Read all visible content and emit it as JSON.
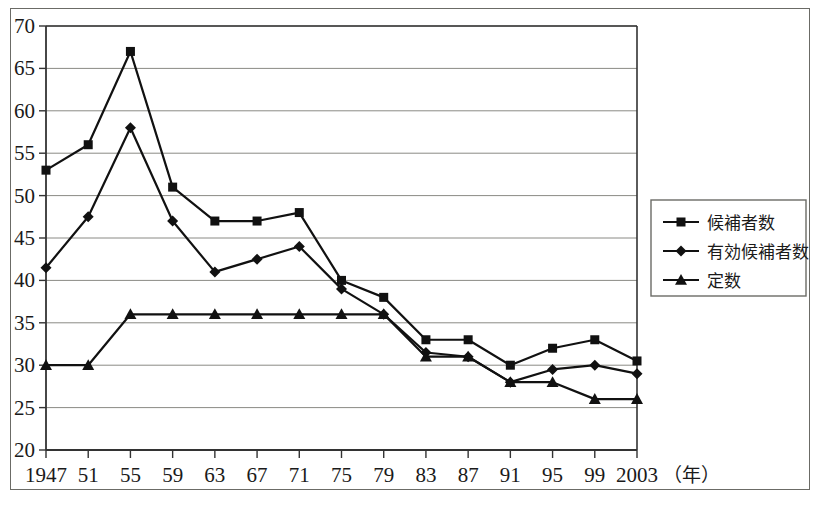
{
  "chart_data": {
    "type": "line",
    "title": "",
    "xlabel": "年",
    "ylabel": "",
    "ylim": [
      20,
      70
    ],
    "ytick_step": 5,
    "grid": true,
    "legend_position": "right",
    "x": [
      1947,
      1951,
      1955,
      1959,
      1963,
      1967,
      1971,
      1975,
      1979,
      1983,
      1987,
      1991,
      1995,
      1999,
      2003
    ],
    "categories": [
      "1947",
      "51",
      "55",
      "59",
      "63",
      "67",
      "71",
      "75",
      "79",
      "83",
      "87",
      "91",
      "95",
      "99",
      "2003"
    ],
    "yticks": [
      "20",
      "25",
      "30",
      "35",
      "40",
      "45",
      "50",
      "55",
      "60",
      "65",
      "70"
    ],
    "series": [
      {
        "name": "候補者数",
        "marker": "square",
        "color": "#111111",
        "values": [
          53,
          56,
          67,
          51,
          47,
          47,
          48,
          40,
          38,
          33,
          33,
          30,
          32,
          33,
          30.5
        ]
      },
      {
        "name": "有効候補者数",
        "marker": "diamond",
        "color": "#111111",
        "values": [
          41.5,
          47.5,
          58,
          47,
          41,
          42.5,
          44,
          39,
          36,
          31.5,
          31,
          28,
          29.5,
          30,
          29
        ]
      },
      {
        "name": "定数",
        "marker": "triangle",
        "color": "#111111",
        "values": [
          30,
          30,
          36,
          36,
          36,
          36,
          36,
          36,
          36,
          31,
          31,
          28,
          28,
          26,
          26
        ]
      }
    ]
  },
  "axis": {
    "x_unit_label": "（年）"
  },
  "legend": {
    "entries": [
      {
        "label": "候補者数",
        "marker": "square"
      },
      {
        "label": "有効候補者数",
        "marker": "diamond"
      },
      {
        "label": "定数",
        "marker": "triangle"
      }
    ]
  },
  "colors": {
    "line": "#111111",
    "grid": "#8a8a85",
    "axis": "#333333",
    "frame": "#6b6b66",
    "background": "#ffffff"
  }
}
